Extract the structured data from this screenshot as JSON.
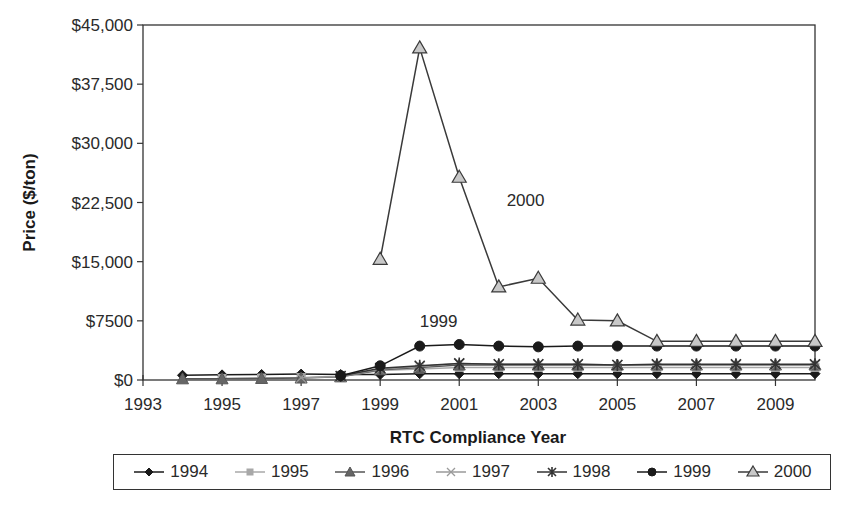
{
  "chart_data": {
    "type": "line",
    "title": "",
    "xlabel": "RTC Compliance Year",
    "ylabel": "Price ($/ton)",
    "xlim": [
      1993,
      2010
    ],
    "ylim": [
      0,
      45000
    ],
    "x_ticks": [
      1993,
      1995,
      1997,
      1999,
      2001,
      2003,
      2005,
      2007,
      2009
    ],
    "y_ticks": [
      0,
      7500,
      15000,
      22500,
      30000,
      37500,
      45000
    ],
    "y_tick_labels": [
      "$0",
      "$7500",
      "$15,000",
      "$22,500",
      "$30,000",
      "$37,500",
      "$45,000"
    ],
    "grid": false,
    "legend_position": "bottom",
    "annotations": [
      {
        "text": "2000",
        "x": 2002.2,
        "y": 22000
      },
      {
        "text": "1999",
        "x": 2000.0,
        "y": 6700
      }
    ],
    "series": [
      {
        "name": "1994",
        "marker": "diamond",
        "color": "#1a1a1a",
        "fill": "#1a1a1a",
        "x": [
          1994,
          1995,
          1996,
          1997,
          1998,
          1999,
          2000,
          2001,
          2002,
          2003,
          2004,
          2005,
          2006,
          2007,
          2008,
          2009,
          2010
        ],
        "values": [
          600,
          650,
          700,
          750,
          700,
          700,
          800,
          800,
          800,
          800,
          800,
          800,
          800,
          800,
          800,
          800,
          800
        ]
      },
      {
        "name": "1995",
        "marker": "square",
        "color": "#a8a8a8",
        "fill": "#a8a8a8",
        "x": [
          1995,
          1996,
          1997,
          1998,
          1999,
          2000,
          2001,
          2002,
          2003,
          2004,
          2005,
          2006,
          2007,
          2008,
          2009,
          2010
        ],
        "values": [
          200,
          250,
          300,
          400,
          1200,
          1400,
          1600,
          1600,
          1600,
          1600,
          1600,
          1600,
          1600,
          1600,
          1600,
          1600
        ]
      },
      {
        "name": "1996",
        "marker": "triangle",
        "color": "#555555",
        "fill": "#666666",
        "x": [
          1994,
          1995,
          1996,
          1997,
          1998,
          1999,
          2000,
          2001,
          2002,
          2003,
          2004,
          2005,
          2006,
          2007,
          2008,
          2009,
          2010
        ],
        "values": [
          150,
          150,
          200,
          250,
          400,
          1300,
          1600,
          1900,
          1900,
          1900,
          1900,
          1900,
          1900,
          1900,
          1900,
          1900,
          1900
        ]
      },
      {
        "name": "1997",
        "marker": "x",
        "color": "#9a9a9a",
        "fill": "none",
        "x": [
          1997,
          1998,
          1999,
          2000,
          2001,
          2002,
          2003,
          2004,
          2005,
          2006,
          2007,
          2008,
          2009,
          2010
        ],
        "values": [
          300,
          450,
          1400,
          1700,
          2100,
          2000,
          2000,
          2000,
          1900,
          1900,
          1900,
          1900,
          1900,
          1900
        ]
      },
      {
        "name": "1998",
        "marker": "star",
        "color": "#333333",
        "fill": "#333333",
        "x": [
          1998,
          1999,
          2000,
          2001,
          2002,
          2003,
          2004,
          2005,
          2006,
          2007,
          2008,
          2009,
          2010
        ],
        "values": [
          500,
          1500,
          1800,
          2100,
          2000,
          2000,
          2000,
          1900,
          2000,
          2000,
          2000,
          2000,
          2000
        ]
      },
      {
        "name": "1999",
        "marker": "circle",
        "color": "#1a1a1a",
        "fill": "#1a1a1a",
        "x": [
          1998,
          1999,
          2000,
          2001,
          2002,
          2003,
          2004,
          2005,
          2006,
          2007,
          2008,
          2009,
          2010
        ],
        "values": [
          550,
          1800,
          4300,
          4500,
          4300,
          4200,
          4300,
          4300,
          4300,
          4300,
          4300,
          4300,
          4300
        ]
      },
      {
        "name": "2000",
        "marker": "triangle-open",
        "color": "#3a3a3a",
        "fill": "#c8c8c8",
        "x": [
          1999,
          2000,
          2001,
          2002,
          2003,
          2004,
          2005,
          2006,
          2007,
          2008,
          2009,
          2010
        ],
        "values": [
          15300,
          42100,
          25700,
          11800,
          12900,
          7600,
          7500,
          4900,
          4900,
          4900,
          4900,
          4900
        ]
      }
    ]
  },
  "legend": {
    "items": [
      "1994",
      "1995",
      "1996",
      "1997",
      "1998",
      "1999",
      "2000"
    ]
  }
}
